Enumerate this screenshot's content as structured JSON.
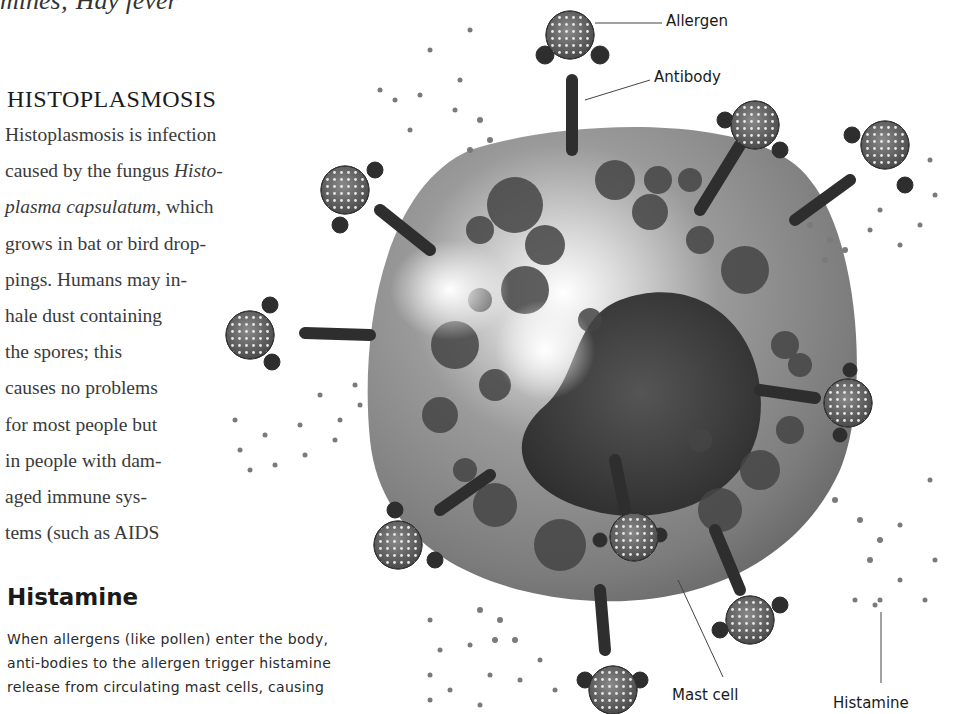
{
  "page": {
    "top_fragment": "mines; Hay fever"
  },
  "histoplasmosis": {
    "heading": "HISTOPLASMOSIS",
    "lines": [
      [
        "Histoplasmosis is infection"
      ],
      [
        "caused by the fungus ",
        "Histo-"
      ],
      [
        "plasma capsulatum",
        ", which"
      ],
      [
        "grows in bat or bird drop-"
      ],
      [
        "pings. Humans may in-"
      ],
      [
        "hale dust containing"
      ],
      [
        "the spores; this"
      ],
      [
        "causes no problems"
      ],
      [
        "for most people but"
      ],
      [
        "in people with dam-"
      ],
      [
        "aged immune sys-"
      ],
      [
        "tems (such as AIDS"
      ]
    ]
  },
  "histamine": {
    "heading": "Histamine",
    "lines": [
      "When allergens (like pollen) enter the body,",
      "anti-bodies to the allergen trigger histamine",
      "release from circulating mast cells, causing"
    ]
  },
  "illustration": {
    "labels": {
      "allergen": "Allergen",
      "antibody": "Antibody",
      "mast_cell": "Mast cell",
      "histamine": "Histamine"
    },
    "colors": {
      "cell_body": "#8a8a8a",
      "nucleus": "#3e3e3e",
      "granule": "#454545",
      "antibody": "#2e2e2e",
      "allergen": "#5a5a5a",
      "histamine_dot": "#7a7a7a"
    }
  }
}
